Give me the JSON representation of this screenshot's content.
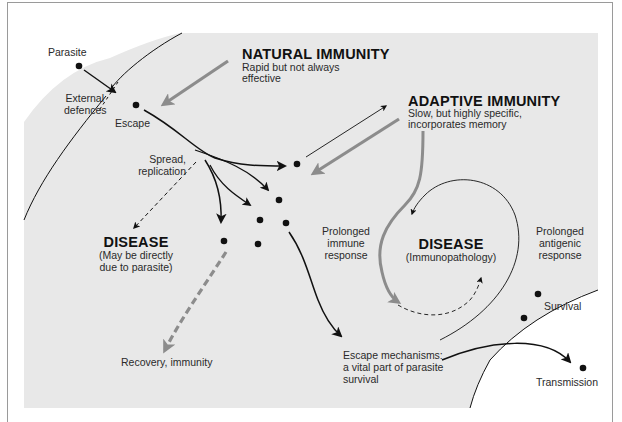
{
  "diagram": {
    "colors": {
      "background": "#ffffff",
      "body_region": "#e8e8e8",
      "frame": "#9a9a9a",
      "line": "#111111",
      "immune_arrow": "#8c8c8c"
    },
    "external": {
      "parasite_label": "Parasite",
      "external_defences_label": [
        "External",
        "defences"
      ],
      "escape_label": "Escape"
    },
    "natural_immunity": {
      "title": "NATURAL IMMUNITY",
      "subtitle": [
        "Rapid but not always",
        "effective"
      ]
    },
    "adaptive_immunity": {
      "title": "ADAPTIVE IMMUNITY",
      "subtitle": [
        "Slow, but highly specific,",
        "incorporates memory"
      ]
    },
    "spread": {
      "label": [
        "Spread,",
        "replication"
      ]
    },
    "disease_direct": {
      "title": "DISEASE",
      "subtitle": [
        "(May be directly",
        "due to parasite)"
      ]
    },
    "prolonged_immune": {
      "label": [
        "Prolonged",
        "immune",
        "response"
      ]
    },
    "disease_immuno": {
      "title": "DISEASE",
      "subtitle": "(Immunopathology)"
    },
    "prolonged_antigenic": {
      "label": [
        "Prolonged",
        "antigenic",
        "response"
      ]
    },
    "recovery": {
      "label": "Recovery, immunity"
    },
    "escape_mechanisms": {
      "label": [
        "Escape mechanisms:",
        "a vital part of parasite",
        "survival"
      ]
    },
    "survival": {
      "label": "Survival"
    },
    "transmission": {
      "label": "Transmission"
    }
  }
}
